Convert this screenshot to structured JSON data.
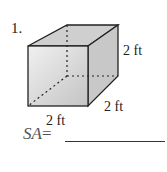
{
  "problem": {
    "number": "1.",
    "shape": "cube",
    "dimensions": {
      "height": "2 ft",
      "depth": "2 ft",
      "width": "2 ft"
    },
    "answer_label": "SA",
    "equals": "=",
    "answer_value": ""
  },
  "colors": {
    "face_fill": "#d6d6d6",
    "edge": "#222222"
  }
}
